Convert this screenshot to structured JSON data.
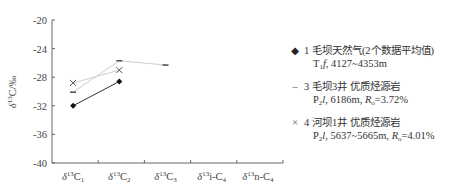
{
  "chart_data": {
    "type": "line",
    "title": "",
    "xlabel": "",
    "ylabel": "δ13C/‰",
    "ylim": [
      -40,
      -20
    ],
    "yticks": [
      -20,
      -24,
      -28,
      -32,
      -36,
      -40
    ],
    "categories": [
      "δ13C1",
      "δ13C2",
      "δ13C3",
      "δ13i-C4",
      "δ13n-C4"
    ],
    "grid": false,
    "legend_position": "right",
    "series": [
      {
        "name": "1 毛坝天然气(2个数据平均值) T1f, 4127~4353m",
        "marker": "diamond",
        "color": "#222222",
        "values": [
          -32.0,
          -28.6,
          null,
          null,
          null
        ]
      },
      {
        "name": "3 毛坝3井 优质烃源岩 P2l, 6186m, Ro=3.72%",
        "marker": "dash",
        "color": "#c8c8c8",
        "values": [
          -30.1,
          -25.7,
          -26.3,
          null,
          null
        ]
      },
      {
        "name": "4 河坝1井 优质烃源岩 P2l, 5637~5665m, Ro=4.01%",
        "marker": "x",
        "color": "#d8d8d8",
        "values": [
          -28.8,
          -27.0,
          null,
          null,
          null
        ]
      }
    ]
  },
  "axis": {
    "ylabel_main": "δ",
    "ylabel_sup": "13",
    "ylabel_rest": "C/‰",
    "yticks": [
      "-20",
      "-24",
      "-28",
      "-32",
      "-36",
      "-40"
    ],
    "xlabels": [
      {
        "pre": "δ",
        "sup": "13",
        "main": "C",
        "sub": "1"
      },
      {
        "pre": "δ",
        "sup": "13",
        "main": "C",
        "sub": "2"
      },
      {
        "pre": "δ",
        "sup": "13",
        "main": "C",
        "sub": "3"
      },
      {
        "pre": "δ",
        "sup": "13",
        "main": "i-C",
        "sub": "4"
      },
      {
        "pre": "δ",
        "sup": "13",
        "main": "n-C",
        "sub": "4"
      }
    ]
  },
  "legend": {
    "items": [
      {
        "marker": "◆",
        "title": "1 毛坝天然气(2个数据平均值)",
        "detail_a": "T",
        "detail_a_sub": "1",
        "detail_b": "f",
        "detail_c": ", 4127~4353m",
        "detail_d": "",
        "detail_d_sub": "",
        "detail_e": ""
      },
      {
        "marker": "–",
        "title": "3 毛坝3井 优质烃源岩",
        "detail_a": "P",
        "detail_a_sub": "2",
        "detail_b": "l",
        "detail_c": ", 6186m, ",
        "detail_d": "R",
        "detail_d_sub": "o",
        "detail_e": "=3.72%"
      },
      {
        "marker": "×",
        "title": "4 河坝1井 优质烃源岩",
        "detail_a": "P",
        "detail_a_sub": "2",
        "detail_b": "l",
        "detail_c": ", 5637~5665m, ",
        "detail_d": "R",
        "detail_d_sub": "o",
        "detail_e": "=4.01%"
      }
    ]
  }
}
